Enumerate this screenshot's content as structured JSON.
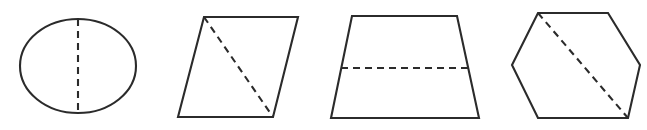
{
  "figure": {
    "canvas": {
      "width": 647,
      "height": 130,
      "background": "#ffffff"
    },
    "style": {
      "outline_color": "#2b2b2b",
      "dashed_color": "#2b2b2b",
      "fill_color": "#ffffff",
      "stroke_width": 2.1,
      "dash_pattern": "7 5"
    },
    "shapes": [
      {
        "id": "circle",
        "name": "circle",
        "label": "circle",
        "geometry": {
          "cx": 78,
          "cy": 66,
          "rx": 58,
          "ry": 47
        },
        "divider": {
          "name": "vertical-dashed-diameter",
          "orientation": "vertical",
          "x1": 78,
          "y1": 19,
          "x2": 78,
          "y2": 113
        }
      },
      {
        "id": "parallelogram",
        "name": "parallelogram",
        "label": "parallelogram",
        "geometry": {
          "points": "204,17 298,17 273,117 178,117"
        },
        "divider": {
          "name": "diagonal-dashed-line",
          "orientation": "diagonal",
          "x1": 204,
          "y1": 17,
          "x2": 273,
          "y2": 117
        }
      },
      {
        "id": "trapezoid",
        "name": "trapezoid",
        "label": "trapezoid",
        "geometry": {
          "points": "352,16 457,16 479,118 331,118"
        },
        "divider": {
          "name": "horizontal-dashed-line",
          "orientation": "horizontal",
          "x1": 341,
          "y1": 68,
          "x2": 468,
          "y2": 68
        }
      },
      {
        "id": "hexagon",
        "name": "hexagon",
        "label": "hexagon",
        "geometry": {
          "points": "538,13 608,13 640,65 628,118 538,118 512,65"
        },
        "divider": {
          "name": "diagonal-dashed-line",
          "orientation": "diagonal",
          "x1": 538,
          "y1": 13,
          "x2": 628,
          "y2": 118
        }
      }
    ]
  }
}
